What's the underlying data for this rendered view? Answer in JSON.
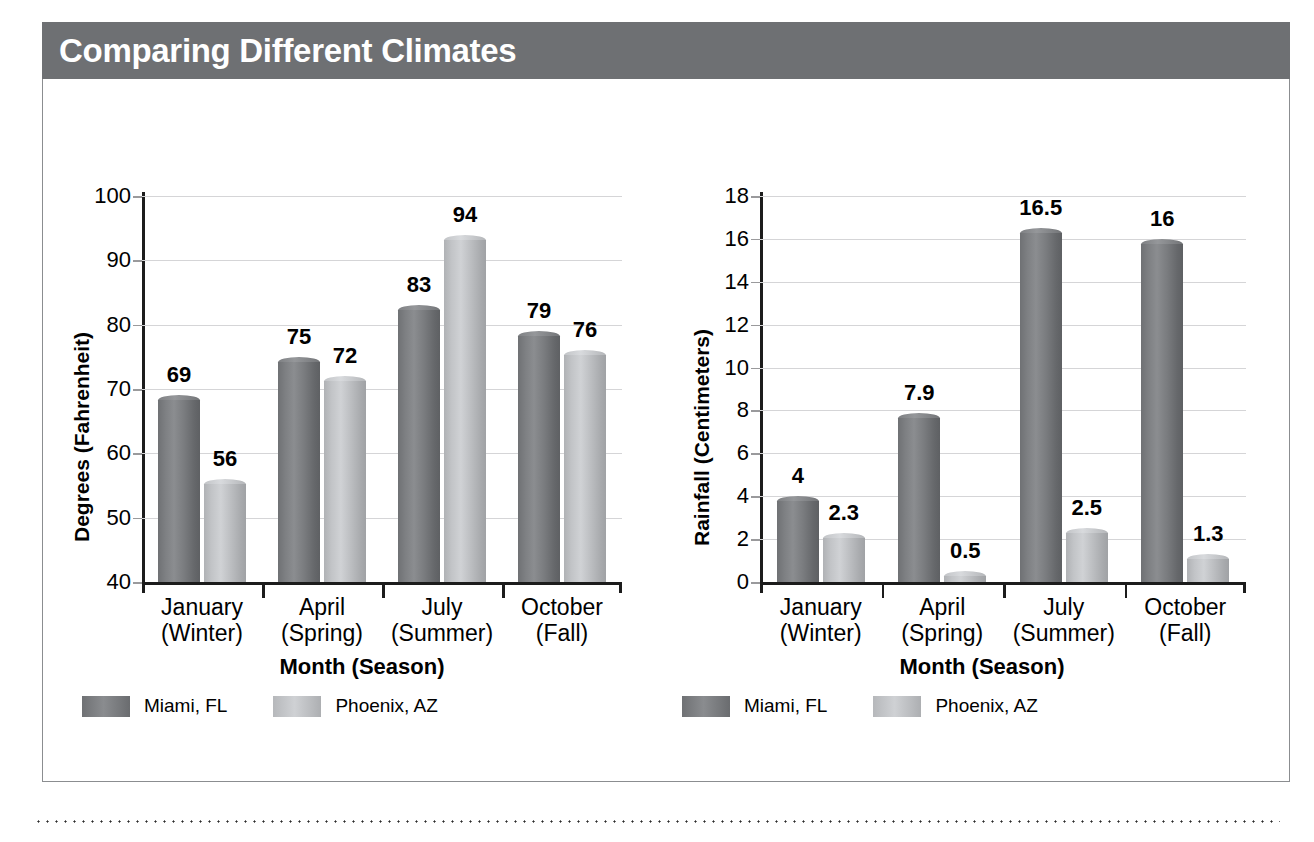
{
  "banner": {
    "title": "Comparing Different Climates"
  },
  "legend": {
    "series": [
      {
        "name": "Miami, FL",
        "color": "#7e8083"
      },
      {
        "name": "Phoenix, AZ",
        "color": "#c6c8cb"
      }
    ]
  },
  "chart_data": [
    {
      "id": "temperature",
      "type": "bar",
      "title": "",
      "xlabel": "Month (Season)",
      "ylabel": "Degrees (Fahrenheit)",
      "categories": [
        "January",
        "April",
        "July",
        "October"
      ],
      "category_sublabels": [
        "(Winter)",
        "(Spring)",
        "(Summer)",
        "(Fall)"
      ],
      "yticks": [
        40,
        50,
        60,
        70,
        80,
        90,
        100
      ],
      "ylim": [
        40,
        100
      ],
      "grid": true,
      "legend_position": "bottom-left",
      "series": [
        {
          "name": "Miami, FL",
          "color": "#7e8083",
          "values": [
            69,
            75,
            83,
            79
          ]
        },
        {
          "name": "Phoenix, AZ",
          "color": "#c6c8cb",
          "values": [
            56,
            72,
            94,
            76
          ]
        }
      ]
    },
    {
      "id": "rainfall",
      "type": "bar",
      "title": "",
      "xlabel": "Month (Season)",
      "ylabel": "Rainfall (Centimeters)",
      "categories": [
        "January",
        "April",
        "July",
        "October"
      ],
      "category_sublabels": [
        "(Winter)",
        "(Spring)",
        "(Summer)",
        "(Fall)"
      ],
      "yticks": [
        0,
        2,
        4,
        6,
        8,
        10,
        12,
        14,
        16,
        18
      ],
      "ylim": [
        0,
        18
      ],
      "grid": true,
      "legend_position": "bottom-left",
      "series": [
        {
          "name": "Miami, FL",
          "color": "#7e8083",
          "values": [
            4,
            7.9,
            16.5,
            16
          ]
        },
        {
          "name": "Phoenix, AZ",
          "color": "#c6c8cb",
          "values": [
            2.3,
            0.5,
            2.5,
            1.3
          ]
        }
      ]
    }
  ]
}
